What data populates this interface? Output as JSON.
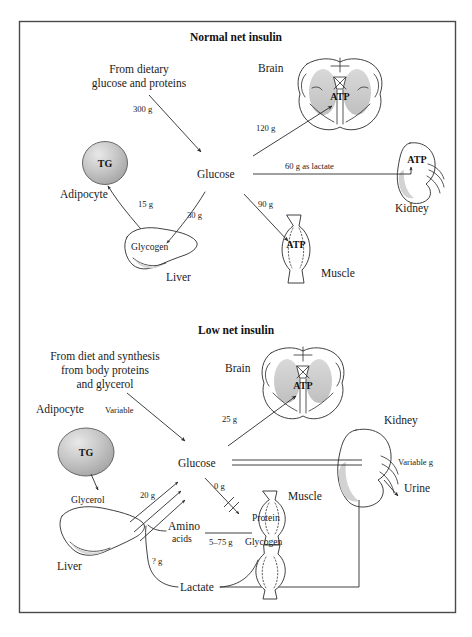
{
  "figure": {
    "panels": [
      {
        "id": "normal",
        "title": "Normal net insulin",
        "source_text_line1": "From dietary",
        "source_text_line2": "glucose and proteins",
        "nodes": {
          "glucose": "Glucose",
          "adipocyte": "Adipocyte",
          "tg": "TG",
          "liver": "Liver",
          "glycogen": "Glycogen",
          "brain": "Brain",
          "brain_atp": "ATP",
          "kidney": "Kidney",
          "kidney_atp": "ATP",
          "muscle": "Muscle",
          "muscle_atp": "ATP"
        },
        "fluxes": [
          {
            "id": "diet-to-glucose",
            "label": "300 g"
          },
          {
            "id": "glucose-to-brain",
            "label": "120 g"
          },
          {
            "id": "kidney-to-glucose",
            "label": "60 g as lactate"
          },
          {
            "id": "glucose-to-muscle",
            "label": "90 g"
          },
          {
            "id": "glucose-to-glycogen",
            "label": "30 g"
          },
          {
            "id": "glycogen-to-tg",
            "label": "15 g"
          }
        ]
      },
      {
        "id": "low",
        "title": "Low net insulin",
        "source_text_line1": "From diet and synthesis",
        "source_text_line2": "from body proteins",
        "source_text_line3": "and glycerol",
        "nodes": {
          "glucose": "Glucose",
          "adipocyte": "Adipocyte",
          "tg": "TG",
          "glycerol": "Glycerol",
          "liver": "Liver",
          "amino_acids_line1": "Amino",
          "amino_acids_line2": "acids",
          "lactate": "Lactate",
          "brain": "Brain",
          "brain_atp": "ATP",
          "kidney": "Kidney",
          "urine": "Urine",
          "muscle": "Muscle",
          "muscle_protein": "Protein",
          "muscle_glycogen": "Glycogen"
        },
        "fluxes": [
          {
            "id": "diet-to-glucose",
            "label": "Variable"
          },
          {
            "id": "glucose-to-brain",
            "label": "25 g"
          },
          {
            "id": "glucose-to-urine",
            "label": "Variable g"
          },
          {
            "id": "glucose-to-muscle-blocked",
            "label": "0 g"
          },
          {
            "id": "liver-to-glucose",
            "label": "20 g"
          },
          {
            "id": "muscle-to-amino-acids",
            "label": "5–75 g"
          },
          {
            "id": "lactate-to-liver",
            "label": "? g"
          }
        ]
      }
    ],
    "colors": {
      "frame": "#4a4a4a",
      "ink": "#2b2b2b",
      "text": "#1a1a1a",
      "organ_fill": "#ffffff",
      "shade_light": "#d9d9d9",
      "shade_mid": "#bdbdbd",
      "shade_dark": "#9a9a9a",
      "background": "#ffffff"
    }
  }
}
